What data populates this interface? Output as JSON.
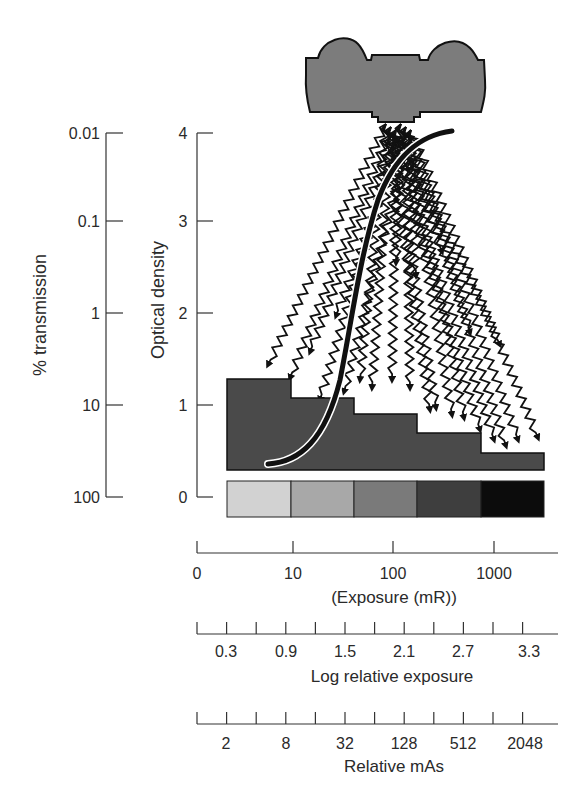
{
  "chart_data": {
    "type": "diagram",
    "title": "",
    "axes": {
      "transmission": {
        "label": "% transmission",
        "ticks": [
          "0.01",
          "0.1",
          "1",
          "10",
          "100"
        ]
      },
      "optical_density": {
        "label": "Optical density",
        "ticks": [
          "4",
          "3",
          "2",
          "1",
          "0"
        ]
      },
      "exposure": {
        "label": "(Exposure (mR))",
        "ticks": [
          "0",
          "10",
          "100",
          "1000"
        ]
      },
      "log_relative_exposure": {
        "label": "Log relative exposure",
        "ticks": [
          "0.3",
          "0.9",
          "1.5",
          "2.1",
          "2.7",
          "3.3"
        ]
      },
      "relative_mas": {
        "label": "Relative mAs",
        "ticks": [
          "2",
          "8",
          "32",
          "128",
          "512",
          "2048"
        ]
      }
    },
    "step_wedge": {
      "steps": 5,
      "colors": [
        "#d2d2d2",
        "#a8a8a8",
        "#7a7a7a",
        "#3e3e3e",
        "#0c0c0c"
      ]
    },
    "hd_curve": {
      "description": "Characteristic (H&D) curve rising from low density toe through steep linear region to shoulder near optical density 4",
      "points_od": [
        [
          0.3,
          0.35
        ],
        [
          0.9,
          0.5
        ],
        [
          1.5,
          1.2
        ],
        [
          2.1,
          2.4
        ],
        [
          2.7,
          3.4
        ],
        [
          3.3,
          3.85
        ]
      ]
    },
    "colors": {
      "tube": "#7c7c7c",
      "wedge": "#4a4a4a",
      "curve": "#111111",
      "axis": "#333333"
    }
  }
}
